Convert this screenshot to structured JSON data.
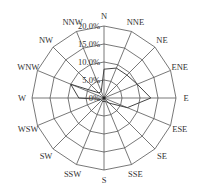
{
  "chart_data": {
    "type": "radar",
    "title": "",
    "directions": [
      "N",
      "NNE",
      "NE",
      "ENE",
      "E",
      "ESE",
      "SE",
      "SSE",
      "S",
      "SSW",
      "SW",
      "WSW",
      "W",
      "WNW",
      "NW",
      "NNW"
    ],
    "values": [
      8,
      9,
      9,
      10,
      13,
      7,
      2,
      1,
      1,
      1,
      1,
      1,
      7,
      10,
      2,
      2
    ],
    "radial_ticks": [
      "0%",
      "5.0%",
      "10.0%",
      "15.0%",
      "20.0%"
    ],
    "radial_range": [
      0,
      20
    ],
    "grid": true,
    "line_color": "#444444",
    "grid_color": "#555555"
  }
}
